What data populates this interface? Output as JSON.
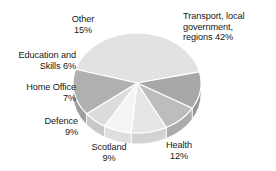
{
  "chart_data": {
    "type": "pie",
    "title": "",
    "subtitle": "",
    "xlabel": "",
    "ylabel": "",
    "legend_position": "external-labels",
    "grid": false,
    "style": "3d-pie",
    "total": 100,
    "units": "percent",
    "categories": [
      "Transport, local government, regions",
      "Health",
      "Scotland",
      "Defence",
      "Home Office",
      "Education and Skills",
      "Other"
    ],
    "values": [
      42,
      12,
      9,
      9,
      7,
      6,
      15
    ],
    "slices": [
      {
        "name": "Transport, local government, regions",
        "value": 42,
        "label_text": "Transport, local\ngovernment,\nregions 42%",
        "color": "#e2e2e2",
        "side_color": "#cfcfcf"
      },
      {
        "name": "Health",
        "value": 12,
        "label_text": "Health\n12%",
        "color": "#a8a8a8",
        "side_color": "#969696"
      },
      {
        "name": "Scotland",
        "value": 9,
        "label_text": "Scotland\n9%",
        "color": "#bdbdbd",
        "side_color": "#ababab"
      },
      {
        "name": "Defence",
        "value": 9,
        "label_text": "Defence\n9%",
        "color": "#e6e6e6",
        "side_color": "#d2d2d2"
      },
      {
        "name": "Home Office",
        "value": 7,
        "label_text": "Home Office\n7%",
        "color": "#f4f4f4",
        "side_color": "#dedede"
      },
      {
        "name": "Education and Skills",
        "value": 6,
        "label_text": "Education and\nSkills 6%",
        "color": "#dcdcdc",
        "side_color": "#c8c8c8"
      },
      {
        "name": "Other",
        "value": 15,
        "label_text": "Other\n15%",
        "color": "#b0b0b0",
        "side_color": "#9e9e9e"
      }
    ],
    "background_color": "#ffffff",
    "separator_color": "#ffffff"
  },
  "labels": {
    "transport": "Transport, local\ngovernment,\nregions 42%",
    "health": "Health\n12%",
    "scotland": "Scotland\n9%",
    "defence": "Defence\n9%",
    "home_office": "Home Office\n7%",
    "education": "Education and\nSkills 6%",
    "other": "Other\n15%"
  }
}
